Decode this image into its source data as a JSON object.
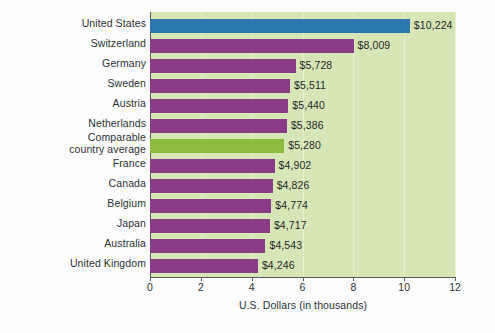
{
  "chart_data": {
    "type": "bar",
    "orientation": "horizontal",
    "title": "",
    "xlabel": "U.S. Dollars (in thousands)",
    "ylabel": "",
    "xlim": [
      0,
      12
    ],
    "xticks": [
      "0",
      "2",
      "4",
      "6",
      "8",
      "10",
      "12"
    ],
    "grid": true,
    "legend": "none",
    "categories": [
      "United States",
      "Switzerland",
      "Germany",
      "Sweden",
      "Austria",
      "Netherlands",
      "Comparable country average",
      "France",
      "Canada",
      "Belgium",
      "Japan",
      "Australia",
      "United Kingdom"
    ],
    "category_lines": [
      [
        "United States"
      ],
      [
        "Switzerland"
      ],
      [
        "Germany"
      ],
      [
        "Sweden"
      ],
      [
        "Austria"
      ],
      [
        "Netherlands"
      ],
      [
        "Comparable",
        "country average"
      ],
      [
        "France"
      ],
      [
        "Canada"
      ],
      [
        "Belgium"
      ],
      [
        "Japan"
      ],
      [
        "Australia"
      ],
      [
        "United Kingdom"
      ]
    ],
    "values": [
      10.224,
      8.009,
      5.728,
      5.511,
      5.44,
      5.386,
      5.28,
      4.902,
      4.826,
      4.774,
      4.717,
      4.543,
      4.246
    ],
    "data_labels": [
      "$10,224",
      "$8,009",
      "$5,728",
      "$5,511",
      "$5,440",
      "$5,386",
      "$5,280",
      "$4,902",
      "$4,826",
      "$4,774",
      "$4,717",
      "$4,543",
      "$4,246"
    ],
    "bar_colors": [
      "#2a76ad",
      "#8a3b88",
      "#8a3b88",
      "#8a3b88",
      "#8a3b88",
      "#8a3b88",
      "#8cbc3d",
      "#8a3b88",
      "#8a3b88",
      "#8a3b88",
      "#8a3b88",
      "#8a3b88",
      "#8a3b88"
    ],
    "plot_background": "#d7e6b5"
  }
}
